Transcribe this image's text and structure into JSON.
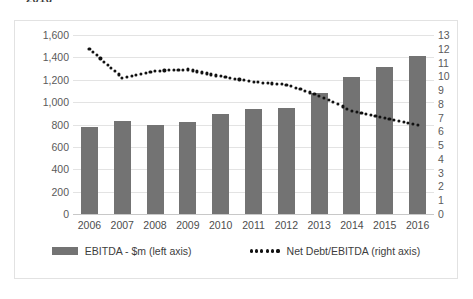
{
  "title_fragment": "2016",
  "chart_data": {
    "type": "bar",
    "title": "",
    "subtitle": "",
    "xlabel": "",
    "ylabel": "",
    "grid": true,
    "legend_position": "bottom",
    "categories": [
      "2006",
      "2007",
      "2008",
      "2009",
      "2010",
      "2011",
      "2012",
      "2013",
      "2014",
      "2015",
      "2016"
    ],
    "series": [
      {
        "name": "EBITDA - $m (left axis)",
        "type": "bar",
        "axis": "left",
        "color": "#737373",
        "values": [
          780,
          830,
          800,
          825,
          890,
          940,
          950,
          1085,
          1225,
          1315,
          1410
        ]
      },
      {
        "name": "Net Debt/EBITDA (right axis)",
        "type": "line",
        "style": "dotted",
        "axis": "right",
        "color": "#111111",
        "values": [
          12.0,
          9.9,
          10.4,
          10.5,
          10.0,
          9.6,
          9.4,
          8.6,
          7.5,
          7.0,
          6.5
        ]
      }
    ],
    "left_axis": {
      "ylim": [
        0,
        1600
      ],
      "tick_step": 200,
      "ticks": [
        1600,
        1400,
        1200,
        1000,
        800,
        600,
        400,
        200,
        0
      ],
      "tick_labels": [
        "1,600",
        "1,400",
        "1,200",
        "1,000",
        "800",
        "600",
        "400",
        "200",
        "0"
      ]
    },
    "right_axis": {
      "ylim": [
        0,
        13
      ],
      "tick_step": 1,
      "ticks": [
        13,
        12,
        11,
        10,
        9,
        8,
        7,
        6,
        5,
        4,
        3,
        2,
        1,
        0
      ],
      "tick_labels": [
        "13",
        "12",
        "11",
        "10",
        "9",
        "8",
        "7",
        "6",
        "5",
        "4",
        "3",
        "2",
        "1",
        "0"
      ]
    }
  },
  "legend": {
    "items": [
      {
        "label": "EBITDA - $m (left axis)",
        "marker": "bar-swatch",
        "color": "#737373"
      },
      {
        "label": "Net Debt/EBITDA (right axis)",
        "marker": "dotted-line-swatch",
        "color": "#111111"
      }
    ]
  }
}
